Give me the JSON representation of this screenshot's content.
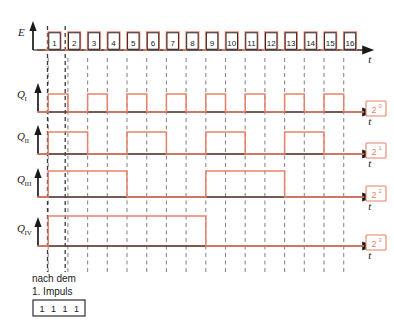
{
  "diagram": {
    "type": "timing-diagram",
    "title_caption": [
      "nach dem",
      "1. Impuls"
    ],
    "state_box": {
      "digits": [
        "1",
        "1",
        "1",
        "1"
      ]
    },
    "time_axis_label": "t",
    "colors": {
      "waveform": "#e8826b",
      "baseline": "#c8766a",
      "axis": "#1a1a1a",
      "grid_dashed": "#8c8c8c",
      "marker_dashed": "#3a3a3a",
      "weight_box_border": "#e8826b",
      "background": "#ffffff"
    },
    "pulse_numbers": [
      "1",
      "2",
      "3",
      "4",
      "5",
      "6",
      "7",
      "8",
      "9",
      "10",
      "11",
      "12",
      "13",
      "14",
      "15",
      "16"
    ],
    "rows": [
      {
        "label": "E",
        "label_sub": "",
        "weight": "",
        "weight_sup": "",
        "kind": "clock",
        "period_pulses": 1
      },
      {
        "label": "Q",
        "label_sub": "I",
        "weight": "2",
        "weight_sup": "0",
        "kind": "divider",
        "period_pulses": 2
      },
      {
        "label": "Q",
        "label_sub": "II",
        "weight": "2",
        "weight_sup": "1",
        "kind": "divider",
        "period_pulses": 4
      },
      {
        "label": "Q",
        "label_sub": "III",
        "weight": "2",
        "weight_sup": "2",
        "kind": "divider",
        "period_pulses": 8
      },
      {
        "label": "Q",
        "label_sub": "IV",
        "weight": "2",
        "weight_sup": "3",
        "kind": "divider",
        "period_pulses": 16
      }
    ]
  },
  "chart_data": {
    "type": "line",
    "xlabel": "t",
    "ylabel": "",
    "categories": [
      "1",
      "2",
      "3",
      "4",
      "5",
      "6",
      "7",
      "8",
      "9",
      "10",
      "11",
      "12",
      "13",
      "14",
      "15",
      "16"
    ],
    "series": [
      {
        "name": "E",
        "weight": "",
        "values": [
          1,
          1,
          1,
          1,
          1,
          1,
          1,
          1,
          1,
          1,
          1,
          1,
          1,
          1,
          1,
          1
        ],
        "note": "clock pulse train, 16 numbered pulses"
      },
      {
        "name": "Q_I",
        "weight": "2^0",
        "values": [
          1,
          0,
          1,
          0,
          1,
          0,
          1,
          0,
          1,
          0,
          1,
          0,
          1,
          0,
          1,
          0
        ]
      },
      {
        "name": "Q_II",
        "weight": "2^1",
        "values": [
          1,
          1,
          0,
          0,
          1,
          1,
          0,
          0,
          1,
          1,
          0,
          0,
          1,
          1,
          0,
          0
        ]
      },
      {
        "name": "Q_III",
        "weight": "2^2",
        "values": [
          1,
          1,
          1,
          1,
          0,
          0,
          0,
          0,
          1,
          1,
          1,
          1,
          0,
          0,
          0,
          0
        ]
      },
      {
        "name": "Q_IV",
        "weight": "2^3",
        "values": [
          1,
          1,
          1,
          1,
          1,
          1,
          1,
          1,
          0,
          0,
          0,
          0,
          0,
          0,
          0,
          0
        ]
      }
    ],
    "grid": true,
    "legend": "right-boxes"
  }
}
